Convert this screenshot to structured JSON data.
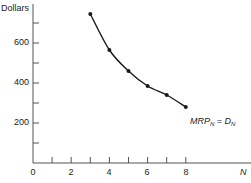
{
  "chart_data": {
    "type": "line",
    "title": "",
    "xlabel": "N",
    "ylabel": "Dollars",
    "x": [
      3,
      4,
      5,
      6,
      7,
      8
    ],
    "series": [
      {
        "name": "MRP_N = D_N",
        "values": [
          745,
          565,
          460,
          385,
          340,
          280
        ]
      }
    ],
    "xlim": [
      0,
      11
    ],
    "ylim": [
      0,
      790
    ],
    "x_ticks": [
      0,
      1,
      2,
      3,
      4,
      5,
      6,
      7,
      8
    ],
    "x_tick_labels": [
      "0",
      "2",
      "4",
      "6",
      "8"
    ],
    "y_ticks": [
      100,
      200,
      300,
      400,
      500,
      600,
      700
    ],
    "y_tick_labels": [
      "200",
      "400",
      "600"
    ],
    "grid": false,
    "legend": null,
    "annotations": [
      {
        "text": "MRP_N = D_N",
        "x": 8.2,
        "y": 215
      }
    ],
    "markers": true
  },
  "labels": {
    "ylabel": "Dollars",
    "xlabel": "N",
    "annotation_main_1": "MRP",
    "annotation_sub_1": "N",
    "annotation_eq": " = D",
    "annotation_sub_2": "N",
    "ytick_200": "200",
    "ytick_400": "400",
    "ytick_600": "600",
    "xtick_0": "0",
    "xtick_2": "2",
    "xtick_4": "4",
    "xtick_6": "6",
    "xtick_8": "8"
  },
  "colors": {
    "line": "#1a1a1a",
    "axis": "#555555"
  }
}
